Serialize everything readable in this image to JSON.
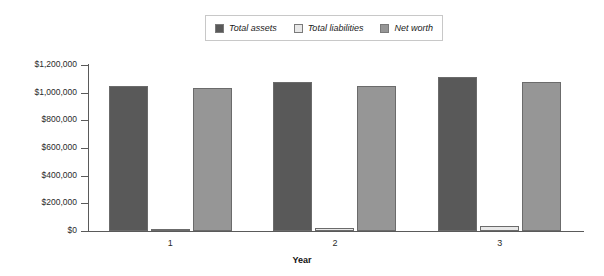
{
  "chart_data": {
    "type": "bar",
    "title": "",
    "xlabel": "Year",
    "ylabel": "",
    "categories": [
      "1",
      "2",
      "3"
    ],
    "ylim": [
      0,
      1200000
    ],
    "ytick_values": [
      0,
      200000,
      400000,
      600000,
      800000,
      1000000,
      1200000
    ],
    "ytick_labels": [
      "$0",
      "$200,000",
      "$400,000",
      "$600,000",
      "$800,000",
      "$1,000,000",
      "$1,200,000"
    ],
    "grid": false,
    "legend_position": "top-center",
    "series": [
      {
        "name": "Total assets",
        "color": "#595959",
        "values": [
          1045000,
          1075000,
          1110000
        ]
      },
      {
        "name": "Total liabilities",
        "color": "#e8e8e8",
        "values": [
          10000,
          25000,
          35000
        ]
      },
      {
        "name": "Net worth",
        "color": "#969696",
        "values": [
          1032000,
          1050000,
          1075000
        ]
      }
    ]
  },
  "legend": {
    "entries": [
      {
        "label": "Total assets",
        "color": "#595959"
      },
      {
        "label": "Total liabilities",
        "color": "#e8e8e8"
      },
      {
        "label": "Net worth",
        "color": "#969696"
      }
    ]
  },
  "axes": {
    "x_title": "Year"
  }
}
